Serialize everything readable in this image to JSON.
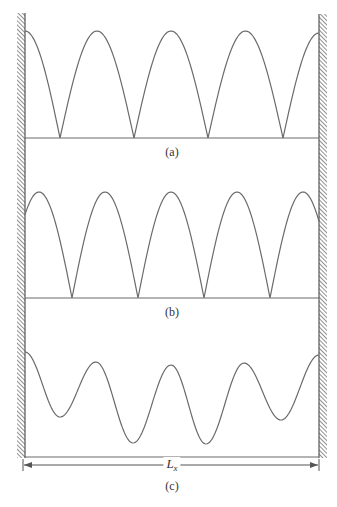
{
  "figure": {
    "stroke_color": "#6a6a6a",
    "line_color": "#6a6a6a",
    "wall_color": "#555555",
    "walls": {
      "left": {
        "x_inner": 25,
        "x_outer": 17,
        "y_top": 13,
        "y_bottom": 458
      },
      "right": {
        "x_inner": 319,
        "x_outer": 327,
        "y_top": 14,
        "y_bottom": 458
      }
    },
    "panels": [
      {
        "id": "a",
        "label": "(a)",
        "label_pos": {
          "x": 172,
          "y": 146
        },
        "baseline_y": 138,
        "description": "Antinodes at both walls; cusp-shaped nodes on baseline",
        "peaks_x": [
          25,
          98,
          172,
          246,
          319
        ],
        "peak_y": 31,
        "nodes_x": [
          60,
          134,
          208,
          283
        ]
      },
      {
        "id": "b",
        "label": "(b)",
        "label_pos": {
          "x": 172,
          "y": 306
        },
        "baseline_y": 298,
        "description": "Curve meets walls mid-height; five peaks, four cusp nodes",
        "wall_y": 215,
        "peaks_x": [
          40,
          106,
          171,
          237,
          303
        ],
        "peak_y": 192,
        "nodes_x": [
          72,
          138,
          204,
          270
        ]
      },
      {
        "id": "c",
        "label": "(c)",
        "label_pos": {
          "x": 172,
          "y": 480
        },
        "baseline_y": 457,
        "description": "Smooth wave with rounded troughs of varying depth",
        "points": [
          {
            "x": 25,
            "y": 352
          },
          {
            "x": 60,
            "y": 417
          },
          {
            "x": 96,
            "y": 362
          },
          {
            "x": 133,
            "y": 443
          },
          {
            "x": 171,
            "y": 365
          },
          {
            "x": 206,
            "y": 444
          },
          {
            "x": 244,
            "y": 363
          },
          {
            "x": 281,
            "y": 420
          },
          {
            "x": 319,
            "y": 355
          }
        ]
      }
    ],
    "dimension": {
      "label_main": "L",
      "label_sub": "x",
      "y": 465,
      "x_start": 23,
      "x_end": 319,
      "label_x": 172
    }
  }
}
